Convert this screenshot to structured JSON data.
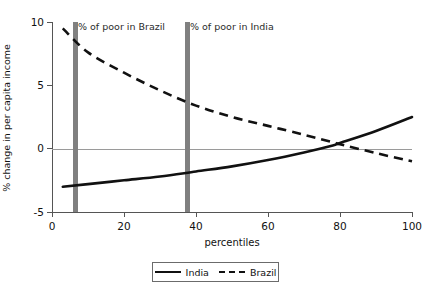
{
  "title": "and Brazil and India",
  "axes": {
    "ylabel": "% change in per capita income",
    "xlabel": "percentiles",
    "yticks": [
      "10",
      "5",
      "0",
      "-5"
    ],
    "xticks": [
      "0",
      "20",
      "40",
      "60",
      "80",
      "100"
    ]
  },
  "annotations": {
    "brazil_marker": "% of poor in Brazil",
    "india_marker": "% of poor in India"
  },
  "legend": {
    "india_label": "India",
    "brazil_label": "Brazil"
  },
  "colors": {
    "line": "#111111",
    "marker_bar": "#808080",
    "axis": "#555555",
    "zeroline": "#9a9a9a"
  },
  "chart_data": {
    "type": "line",
    "title": "and Brazil and India",
    "xlabel": "percentiles",
    "ylabel": "% change in per capita income",
    "xlim": [
      0,
      100
    ],
    "ylim": [
      -5,
      10
    ],
    "xticks": [
      0,
      20,
      40,
      60,
      80,
      100
    ],
    "yticks": [
      -5,
      0,
      5,
      10
    ],
    "grid": false,
    "zero_reference_line": 0,
    "legend_position": "bottom-center",
    "x": [
      3,
      10,
      20,
      30,
      40,
      50,
      60,
      70,
      78,
      80,
      90,
      100
    ],
    "series": [
      {
        "name": "India",
        "style": "solid",
        "values": [
          -3.0,
          -2.8,
          -2.5,
          -2.2,
          -1.8,
          -1.4,
          -0.9,
          -0.3,
          0.25,
          0.45,
          1.4,
          2.5
        ]
      },
      {
        "name": "Brazil",
        "style": "dashed",
        "values": [
          9.5,
          7.6,
          6.0,
          4.6,
          3.4,
          2.5,
          1.8,
          1.1,
          0.5,
          0.35,
          -0.35,
          -1.0
        ]
      }
    ],
    "vertical_markers": [
      {
        "label": "% of poor in Brazil",
        "x": 6.5
      },
      {
        "label": "% of poor in India",
        "x": 37.5
      }
    ]
  }
}
